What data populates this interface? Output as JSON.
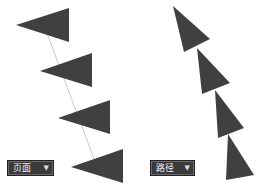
{
  "panels": {
    "left": {
      "dropdown_label": "页面",
      "dropdown_icon": "chevron-down-icon",
      "triangles": [
        [
          [
            16,
            25
          ],
          [
            69,
            8
          ],
          [
            69,
            42
          ]
        ],
        [
          [
            40,
            71
          ],
          [
            92,
            53
          ],
          [
            92,
            87
          ]
        ],
        [
          [
            58,
            118
          ],
          [
            110,
            100
          ],
          [
            110,
            134
          ]
        ],
        [
          [
            71,
            167
          ],
          [
            123,
            149
          ],
          [
            123,
            183
          ]
        ]
      ],
      "path_line": [
        [
          44,
          25
        ],
        [
          97,
          167
        ]
      ]
    },
    "right": {
      "dropdown_label": "路径",
      "dropdown_icon": "chevron-down-icon",
      "triangles": [
        [
          [
            173,
            6
          ],
          [
            210,
            39
          ],
          [
            184,
            52
          ]
        ],
        [
          [
            197,
            48
          ],
          [
            230,
            83
          ],
          [
            202,
            94
          ]
        ],
        [
          [
            215,
            90
          ],
          [
            244,
            128
          ],
          [
            218,
            138
          ]
        ],
        [
          [
            228,
            134
          ],
          [
            254,
            175
          ],
          [
            226,
            180
          ]
        ]
      ]
    }
  },
  "colors": {
    "triangle_fill": "#404040",
    "path_line": "#c8c8c8",
    "dropdown_bg": "#3a3a3a"
  }
}
